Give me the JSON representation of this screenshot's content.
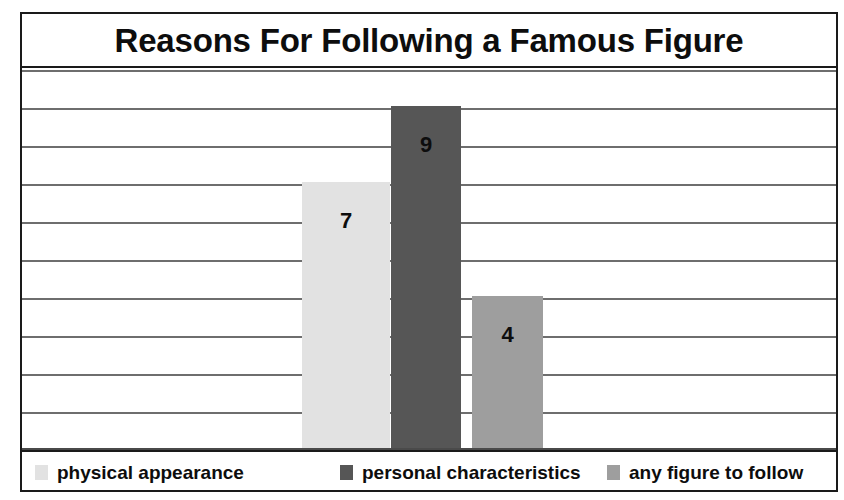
{
  "chart_data": {
    "type": "bar",
    "title": "Reasons For Following a Famous Figure",
    "xlabel": "",
    "ylabel": "",
    "categories": [
      "physical appearance",
      "personal characteristics",
      "any figure to follow"
    ],
    "values": [
      7,
      9,
      4
    ],
    "data_labels": [
      "7",
      "9",
      "4"
    ],
    "ylim": [
      0,
      10
    ],
    "ytick_values": [
      1,
      2,
      3,
      4,
      5,
      6,
      7,
      8,
      9,
      10
    ],
    "ytick_labels_visible": false,
    "grid": true,
    "grid_orientation": "horizontal",
    "legend_position": "bottom",
    "series": [
      {
        "name": "physical appearance",
        "value": 7,
        "label": "7",
        "color": "#e2e2e2",
        "left_px": 280,
        "width_px": 88
      },
      {
        "name": "personal characteristics",
        "value": 9,
        "label": "9",
        "color": "#565656",
        "left_px": 369,
        "width_px": 70
      },
      {
        "name": "any figure to follow",
        "value": 4,
        "label": "4",
        "color": "#9e9e9e",
        "left_px": 450,
        "width_px": 71
      }
    ]
  },
  "legend": {
    "items": [
      {
        "label": "physical appearance",
        "color": "#e2e2e2",
        "left_px": 13
      },
      {
        "label": "personal characteristics",
        "color": "#565656",
        "left_px": 318
      },
      {
        "label": "any figure to follow",
        "color": "#9e9e9e",
        "left_px": 585
      }
    ]
  },
  "colors": {
    "frame": "#1a1a1a",
    "gridline": "#6e6e6e",
    "background": "#ffffff",
    "text": "#0d0d0d"
  }
}
